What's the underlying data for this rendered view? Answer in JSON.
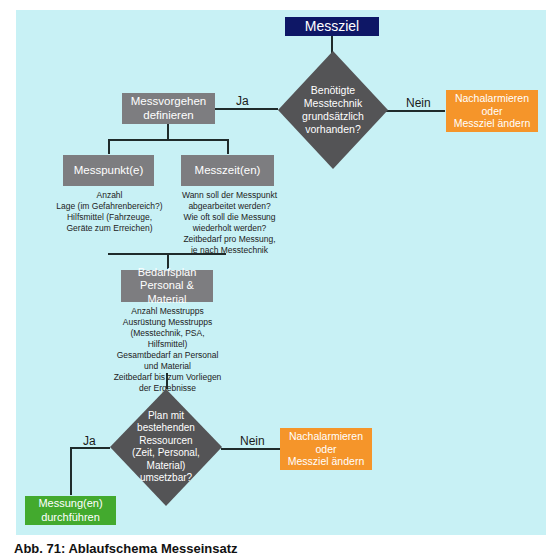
{
  "colors": {
    "background_panel": "#c8f1f5",
    "navy": "#0e1766",
    "grey": "#7d7d80",
    "diamond": "#545456",
    "orange": "#f5952a",
    "green": "#43aa2e"
  },
  "nodes": {
    "start": "Messziel",
    "decision1": "Benötigte\nMesstechnik\ngrundsätzlich\nvorhanden?",
    "decision1_no_target": "Nachalarmieren\noder\nMessziel ändern",
    "define": "Messvorgehen\ndefinieren",
    "measure_points": "Messpunkt(e)",
    "measure_times": "Messzeit(en)",
    "plan": "Bedarfsplan\nPersonal & Material",
    "decision2": "Plan mit\nbestehenden\nRessourcen\n(Zeit, Personal,\nMaterial)\numsetzbar?",
    "decision2_no_target": "Nachalarmieren\noder\nMessziel ändern",
    "execute": "Messung(en)\ndurchführen"
  },
  "notes": {
    "measure_points": "Anzahl\nLage (im Gefahrenbereich?)\nHilfsmittel (Fahrzeuge,\nGeräte zum Erreichen)",
    "measure_times": "Wann soll der Messpunkt\nabgearbeitet werden?\nWie oft soll die Messung\nwiederholt werden?\nZeitbedarf pro Messung,\nje nach Messtechnik",
    "plan": "Anzahl Messtrupps\nAusrüstung Messtrupps\n(Messtechnik, PSA, Hilfsmittel)\nGesamtbedarf an Personal\nund Material\nZeitbedarf bis zum Vorliegen\nder Ergebnisse"
  },
  "edge_labels": {
    "d1_yes": "Ja",
    "d1_no": "Nein",
    "d2_yes": "Ja",
    "d2_no": "Nein"
  },
  "caption": "Abb. 71: Ablaufschema Messeinsatz"
}
